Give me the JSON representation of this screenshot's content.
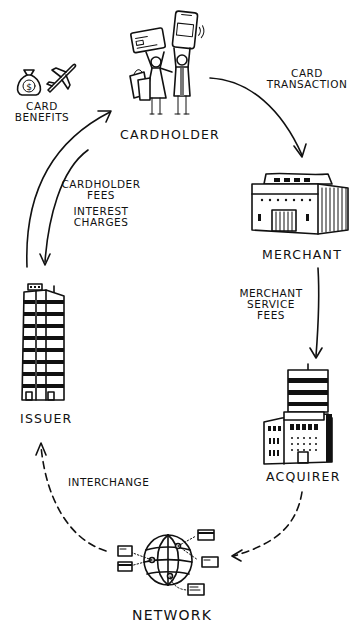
{
  "diagram": {
    "type": "card-payment-flow-cycle",
    "colors": {
      "ink": "#111111",
      "background": "#ffffff"
    },
    "nodes": {
      "cardholder": {
        "label": "Cardholder",
        "icon": "shopping-people-icon"
      },
      "merchant": {
        "label": "Merchant",
        "icon": "store-building-icon"
      },
      "acquirer": {
        "label": "Acquirer",
        "icon": "bank-building-icon"
      },
      "network": {
        "label": "Network",
        "icon": "globe-network-icon"
      },
      "issuer": {
        "label": "Issuer",
        "icon": "tower-building-icon"
      }
    },
    "benefits": {
      "line1": "Card",
      "line2": "Benefits",
      "icons": [
        "money-bag-icon",
        "airplane-icon"
      ]
    },
    "edges": {
      "card_transaction": {
        "from": "cardholder",
        "to": "merchant",
        "line1": "Card",
        "line2": "Transaction",
        "style": "solid"
      },
      "merchant_service_fees": {
        "from": "merchant",
        "to": "acquirer",
        "line1": "Merchant",
        "line2": "Service",
        "line3": "Fees",
        "style": "solid"
      },
      "acquirer_to_network": {
        "from": "acquirer",
        "to": "network",
        "style": "dashed"
      },
      "interchange": {
        "from": "network",
        "to": "issuer",
        "line1": "Interchange",
        "style": "dashed"
      },
      "issuer_to_cardholder": {
        "from": "issuer",
        "to": "cardholder",
        "style": "solid"
      },
      "cardholder_fees": {
        "from": "cardholder",
        "to": "issuer",
        "line1": "Cardholder",
        "line2": "Fees",
        "line3": "Interest",
        "line4": "Charges",
        "style": "solid"
      }
    }
  }
}
